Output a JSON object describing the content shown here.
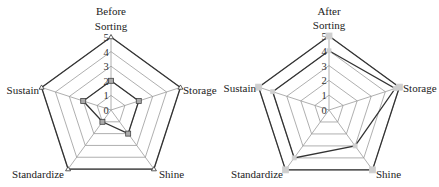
{
  "chart_data": [
    {
      "type": "radar",
      "title": "Before",
      "categories": [
        "Sorting",
        "Storage",
        "Shine",
        "Standardize",
        "Sustain"
      ],
      "rlim": [
        0,
        5
      ],
      "rticks": [
        0,
        1,
        2,
        3,
        4,
        5
      ],
      "series": [
        {
          "name": "Target",
          "values": [
            5,
            5,
            5,
            5,
            5
          ],
          "marker": "triangle",
          "color": "#333333"
        },
        {
          "name": "Before",
          "values": [
            2,
            2,
            2,
            1,
            2
          ],
          "marker": "square",
          "color": "#333333"
        }
      ]
    },
    {
      "type": "radar",
      "title": "After",
      "categories": [
        "Sorting",
        "Storage",
        "Shine",
        "Standardize",
        "Sustain"
      ],
      "rlim": [
        0,
        5
      ],
      "rticks": [
        0,
        1,
        2,
        3,
        4,
        5
      ],
      "series": [
        {
          "name": "Target",
          "values": [
            5,
            5,
            5,
            5,
            5
          ],
          "marker": "square",
          "color": "#333333"
        },
        {
          "name": "After",
          "values": [
            4,
            4.7,
            3,
            4,
            4
          ],
          "marker": "square",
          "color": "#333333"
        }
      ]
    }
  ],
  "charts": {
    "before": {
      "title": "Before",
      "axis_labels": {
        "top": "Sorting",
        "right": "Storage",
        "bottom_right": "Shine",
        "bottom_left": "Standardize",
        "left": "Sustain"
      },
      "ticks": [
        "0",
        "1",
        "2",
        "3",
        "4",
        "5"
      ]
    },
    "after": {
      "title": "After",
      "axis_labels": {
        "top": "Sorting",
        "right": "Storage",
        "bottom_right": "Shine",
        "bottom_left": "Standardize",
        "left": "Sustain"
      },
      "ticks": [
        "0",
        "1",
        "2",
        "3",
        "4",
        "5"
      ]
    }
  }
}
